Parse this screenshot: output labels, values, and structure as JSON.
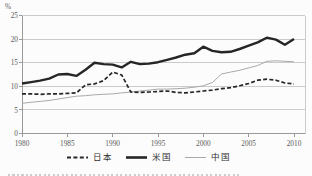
{
  "chart": {
    "colors": {
      "grid": "#cbcbcb",
      "axis": "#9a9a9a",
      "tick_text": "#5a5a5a",
      "legend_text": "#2f2f2f",
      "background": "#fcfcfc"
    }
  },
  "chart_data": {
    "type": "line",
    "title": "",
    "y_unit": "%",
    "xlim": [
      1980,
      2010
    ],
    "ylim": [
      0,
      25
    ],
    "grid": true,
    "legend_position": "bottom",
    "x_ticks": [
      1980,
      1985,
      1990,
      1995,
      2000,
      2005,
      2010
    ],
    "y_ticks": [
      0,
      5,
      10,
      15,
      20,
      25
    ],
    "x": [
      1980,
      1981,
      1982,
      1983,
      1984,
      1985,
      1986,
      1987,
      1988,
      1989,
      1990,
      1991,
      1992,
      1993,
      1994,
      1995,
      1996,
      1997,
      1998,
      1999,
      2000,
      2001,
      2002,
      2003,
      2004,
      2005,
      2006,
      2007,
      2008,
      2009,
      2010
    ],
    "series": [
      {
        "name": "日本",
        "key": "japan",
        "color": "#262626",
        "width": 1.7,
        "dash": "4,2.2",
        "z": 2,
        "values": [
          8.4,
          8.4,
          8.3,
          8.4,
          8.4,
          8.5,
          8.6,
          10.3,
          10.5,
          11.2,
          13.0,
          12.4,
          8.8,
          8.7,
          8.8,
          8.9,
          9.0,
          8.7,
          8.6,
          8.8,
          9.0,
          9.2,
          9.5,
          9.7,
          10.1,
          10.6,
          11.3,
          11.5,
          11.3,
          10.7,
          10.5
        ]
      },
      {
        "name": "米国",
        "key": "usa",
        "color": "#262626",
        "width": 2.4,
        "dash": null,
        "z": 3,
        "values": [
          10.6,
          10.9,
          11.2,
          11.6,
          12.5,
          12.6,
          12.2,
          13.5,
          15.0,
          14.7,
          14.6,
          14.0,
          15.2,
          14.7,
          14.8,
          15.1,
          15.6,
          16.1,
          16.7,
          17.0,
          18.4,
          17.5,
          17.2,
          17.3,
          17.9,
          18.6,
          19.3,
          20.3,
          19.9,
          18.8,
          20.0
        ]
      },
      {
        "name": "中国",
        "key": "china",
        "color": "#a9a9a9",
        "width": 1,
        "dash": null,
        "z": 1,
        "values": [
          6.4,
          6.6,
          6.8,
          7.0,
          7.3,
          7.6,
          7.9,
          8.0,
          8.2,
          8.3,
          8.4,
          8.6,
          8.8,
          9.0,
          9.2,
          9.4,
          9.4,
          9.5,
          9.6,
          9.8,
          10.1,
          10.8,
          12.6,
          13.0,
          13.4,
          13.9,
          14.4,
          15.3,
          15.4,
          15.3,
          15.2
        ]
      }
    ]
  }
}
